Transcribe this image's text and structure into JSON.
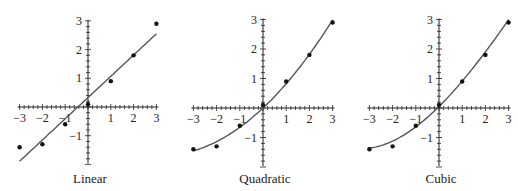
{
  "chart_data": [
    {
      "type": "scatter",
      "title": "Linear",
      "fit": "linear",
      "x": [
        -3,
        -2,
        -1,
        0,
        1,
        2,
        3
      ],
      "y": [
        -1.4,
        -1.3,
        -0.6,
        0.1,
        0.9,
        1.8,
        2.9
      ],
      "fit_coefficients": [
        0.33,
        0.74
      ],
      "xlim": [
        -3,
        3
      ],
      "ylim": [
        -2,
        3
      ],
      "xticks": [
        -3,
        -2,
        -1,
        1,
        2,
        3
      ],
      "yticks": [
        -1,
        1,
        2,
        3
      ],
      "xlabel": "",
      "ylabel": "",
      "grid": false
    },
    {
      "type": "scatter",
      "title": "Quadratic",
      "fit": "quadratic",
      "x": [
        -3,
        -2,
        -1,
        0,
        1,
        2,
        3
      ],
      "y": [
        -1.4,
        -1.3,
        -0.6,
        0.1,
        0.9,
        1.8,
        2.9
      ],
      "fit_coefficients": [
        0.0,
        0.74,
        0.085
      ],
      "xlim": [
        -3,
        3
      ],
      "ylim": [
        -2,
        3
      ],
      "xticks": [
        -3,
        -2,
        -1,
        1,
        2,
        3
      ],
      "yticks": [
        -1,
        1,
        2,
        3
      ],
      "xlabel": "",
      "ylabel": "",
      "grid": false
    },
    {
      "type": "scatter",
      "title": "Cubic",
      "fit": "cubic",
      "x": [
        -3,
        -2,
        -1,
        0,
        1,
        2,
        3
      ],
      "y": [
        -1.4,
        -1.3,
        -0.6,
        0.1,
        0.9,
        1.8,
        2.9
      ],
      "fit_coefficients": [
        0.05,
        0.78,
        0.085,
        -0.006
      ],
      "xlim": [
        -3,
        3
      ],
      "ylim": [
        -2,
        3
      ],
      "xticks": [
        -3,
        -2,
        -1,
        1,
        2,
        3
      ],
      "yticks": [
        -1,
        1,
        2,
        3
      ],
      "xlabel": "",
      "ylabel": "",
      "grid": false
    }
  ],
  "panels": [
    {
      "title": "Linear",
      "ox": 88,
      "oy": 107,
      "sx": 22.8,
      "sy": 28.7
    },
    {
      "title": "Quadratic",
      "ox": 263,
      "oy": 108,
      "sx": 23.2,
      "sy": 29.5
    },
    {
      "title": "Cubic",
      "ox": 439,
      "oy": 108,
      "sx": 23.2,
      "sy": 29.5
    }
  ],
  "colors": {
    "axis": "#222222",
    "curve": "#555555",
    "point": "#111111"
  }
}
